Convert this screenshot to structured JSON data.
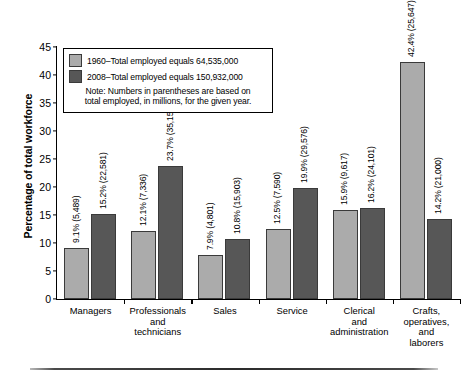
{
  "chart_data": {
    "type": "bar",
    "title": "",
    "xlabel": "",
    "ylabel": "Percentage of total workforce",
    "ylim": [
      0,
      45
    ],
    "yticks": [
      0,
      5,
      10,
      15,
      20,
      25,
      30,
      35,
      40,
      45
    ],
    "grid": false,
    "legend_position": "top-left",
    "categories": [
      "Managers",
      "Professionals and technicians",
      "Sales",
      "Service",
      "Clerical and administration",
      "Crafts, operatives, and laborers"
    ],
    "category_lines": [
      [
        "Managers"
      ],
      [
        "Professionals",
        "and",
        "technicians"
      ],
      [
        "Sales"
      ],
      [
        "Service"
      ],
      [
        "Clerical",
        "and",
        "administration"
      ],
      [
        "Crafts,",
        "operatives,",
        "and",
        "laborers"
      ]
    ],
    "series": [
      {
        "name": "1960",
        "color": "#ababab",
        "legend_label": "1960–Total employed equals 64,535,000",
        "total_employed": "64,535,000",
        "values": [
          9.1,
          12.1,
          7.9,
          12.5,
          15.9,
          42.4
        ],
        "counts": [
          "5,489",
          "7,336",
          "4,801",
          "7,590",
          "9,617",
          "25,647"
        ],
        "labels": [
          "9.1% (5,489)",
          "12.1% (7,336)",
          "7.9% (4,801)",
          "12.5% (7,590)",
          "15.9% (9,617)",
          "42.4% (25,647)"
        ]
      },
      {
        "name": "2008",
        "color": "#575757",
        "legend_label": "2008–Total employed equals 150,932,000",
        "total_employed": "150,932,000",
        "values": [
          15.2,
          23.7,
          10.8,
          19.9,
          16.2,
          14.2
        ],
        "counts": [
          "22,581",
          "35,150",
          "15,903",
          "29,576",
          "24,101",
          "21,000"
        ],
        "labels": [
          "15.2% (22,581)",
          "23.7% (35,150)",
          "10.8% (15,903)",
          "19.9% (29,576)",
          "16.2% (24,101)",
          "14.2% (21,000)"
        ]
      }
    ],
    "note": "Note: Numbers in parentheses are based on total employed, in millions, for the given year.",
    "note_lines": [
      "Note: Numbers in parentheses are based on",
      "total employed, in millions, for the given year."
    ]
  },
  "legend": {
    "row_1960": "1960–Total employed equals 64,535,000",
    "row_2008": "2008–Total employed equals 150,932,000",
    "note_line_1": "Note: Numbers in parentheses are based on",
    "note_line_2": "total employed, in millions, for the given year."
  },
  "axis": {
    "y_title": "Percentage of total workforce"
  },
  "colors": {
    "series_1960": "#ababab",
    "series_2008": "#575757",
    "axis": "#000000"
  }
}
